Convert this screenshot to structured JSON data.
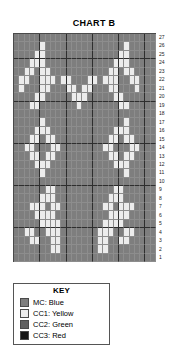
{
  "chart": {
    "title": "CHART B",
    "columns": 27,
    "rows": 27,
    "row_numbers": [
      27,
      26,
      25,
      24,
      23,
      22,
      21,
      20,
      19,
      18,
      17,
      16,
      15,
      14,
      13,
      12,
      11,
      10,
      9,
      8,
      7,
      6,
      5,
      4,
      3,
      2,
      1
    ]
  },
  "legend": {
    "title": "KEY",
    "items": [
      {
        "label": "MC: Blue",
        "code": "MC",
        "color_name": "Blue",
        "swatch": "#7e7e7e",
        "key": "mc"
      },
      {
        "label": "CC1: Yellow",
        "code": "CC1",
        "color_name": "Yellow",
        "swatch": "#ececec",
        "key": "cc1"
      },
      {
        "label": "CC2: Green",
        "code": "CC2",
        "color_name": "Green",
        "swatch": "#616161",
        "key": "cc2"
      },
      {
        "label": "CC3: Red",
        "code": "CC3",
        "color_name": "Red",
        "swatch": "#161616",
        "key": "cc3"
      }
    ]
  },
  "chart_data": {
    "type": "heatmap",
    "title": "CHART B",
    "xlabel": "",
    "ylabel": "",
    "legend_position": "below",
    "grid": true,
    "palette": {
      "mc": "#7e7e7e",
      "cc1": "#ececec",
      "cc2": "#616161",
      "cc3": "#161616"
    },
    "row_order": "top-to-bottom is row 27 down to row 1",
    "cells": [
      [
        "mc",
        "mc",
        "mc",
        "mc",
        "mc",
        "mc",
        "mc",
        "mc",
        "mc",
        "mc",
        "mc",
        "mc",
        "mc",
        "mc",
        "mc",
        "mc",
        "mc",
        "mc",
        "mc",
        "mc",
        "mc",
        "mc",
        "mc",
        "mc",
        "mc",
        "mc",
        "mc"
      ],
      [
        "mc",
        "mc",
        "mc",
        "mc",
        "mc",
        "cc1",
        "mc",
        "mc",
        "mc",
        "mc",
        "mc",
        "mc",
        "mc",
        "mc",
        "mc",
        "mc",
        "mc",
        "mc",
        "mc",
        "mc",
        "mc",
        "cc1",
        "mc",
        "mc",
        "mc",
        "mc",
        "mc"
      ],
      [
        "mc",
        "mc",
        "mc",
        "mc",
        "cc1",
        "cc1",
        "mc",
        "mc",
        "mc",
        "mc",
        "mc",
        "mc",
        "mc",
        "mc",
        "mc",
        "mc",
        "mc",
        "mc",
        "mc",
        "mc",
        "cc1",
        "cc1",
        "mc",
        "mc",
        "mc",
        "mc",
        "mc"
      ],
      [
        "mc",
        "mc",
        "mc",
        "cc1",
        "cc1",
        "cc1",
        "mc",
        "mc",
        "mc",
        "mc",
        "mc",
        "mc",
        "mc",
        "mc",
        "mc",
        "mc",
        "mc",
        "mc",
        "mc",
        "cc1",
        "cc1",
        "cc1",
        "mc",
        "mc",
        "mc",
        "mc",
        "mc"
      ],
      [
        "mc",
        "mc",
        "cc1",
        "cc1",
        "mc",
        "cc1",
        "cc1",
        "mc",
        "mc",
        "mc",
        "mc",
        "mc",
        "mc",
        "mc",
        "mc",
        "mc",
        "mc",
        "mc",
        "cc1",
        "cc1",
        "mc",
        "cc1",
        "cc1",
        "mc",
        "mc",
        "mc",
        "mc"
      ],
      [
        "mc",
        "cc1",
        "cc1",
        "mc",
        "mc",
        "cc1",
        "cc1",
        "cc1",
        "mc",
        "cc1",
        "cc1",
        "mc",
        "mc",
        "mc",
        "cc1",
        "cc1",
        "mc",
        "cc1",
        "cc1",
        "cc1",
        "mc",
        "mc",
        "cc1",
        "cc1",
        "mc",
        "mc",
        "mc"
      ],
      [
        "mc",
        "cc1",
        "mc",
        "mc",
        "mc",
        "cc1",
        "cc1",
        "mc",
        "mc",
        "mc",
        "cc1",
        "cc1",
        "mc",
        "cc1",
        "cc1",
        "mc",
        "mc",
        "mc",
        "cc1",
        "cc1",
        "mc",
        "mc",
        "mc",
        "cc1",
        "mc",
        "mc",
        "mc"
      ],
      [
        "mc",
        "mc",
        "mc",
        "mc",
        "cc1",
        "cc1",
        "mc",
        "mc",
        "mc",
        "mc",
        "mc",
        "cc1",
        "cc1",
        "cc1",
        "mc",
        "mc",
        "mc",
        "mc",
        "mc",
        "cc1",
        "cc1",
        "mc",
        "mc",
        "mc",
        "mc",
        "mc",
        "mc"
      ],
      [
        "mc",
        "mc",
        "mc",
        "cc1",
        "cc1",
        "mc",
        "mc",
        "mc",
        "mc",
        "mc",
        "mc",
        "mc",
        "cc1",
        "mc",
        "mc",
        "mc",
        "mc",
        "mc",
        "mc",
        "mc",
        "cc1",
        "cc1",
        "mc",
        "mc",
        "mc",
        "mc",
        "mc"
      ],
      [
        "mc",
        "mc",
        "mc",
        "mc",
        "mc",
        "mc",
        "mc",
        "mc",
        "mc",
        "mc",
        "mc",
        "mc",
        "mc",
        "mc",
        "mc",
        "mc",
        "mc",
        "mc",
        "mc",
        "mc",
        "mc",
        "mc",
        "mc",
        "mc",
        "mc",
        "mc",
        "mc"
      ],
      [
        "mc",
        "mc",
        "mc",
        "mc",
        "mc",
        "cc1",
        "mc",
        "mc",
        "mc",
        "mc",
        "mc",
        "mc",
        "mc",
        "mc",
        "mc",
        "mc",
        "mc",
        "mc",
        "mc",
        "mc",
        "mc",
        "cc1",
        "mc",
        "mc",
        "mc",
        "mc",
        "mc"
      ],
      [
        "mc",
        "mc",
        "mc",
        "mc",
        "cc1",
        "cc1",
        "cc1",
        "mc",
        "mc",
        "mc",
        "mc",
        "mc",
        "mc",
        "mc",
        "mc",
        "mc",
        "mc",
        "mc",
        "mc",
        "cc1",
        "cc1",
        "cc1",
        "mc",
        "mc",
        "mc",
        "mc",
        "mc"
      ],
      [
        "mc",
        "mc",
        "mc",
        "cc1",
        "cc1",
        "mc",
        "cc1",
        "cc1",
        "mc",
        "mc",
        "mc",
        "mc",
        "mc",
        "mc",
        "mc",
        "mc",
        "mc",
        "mc",
        "cc1",
        "cc1",
        "mc",
        "cc1",
        "cc1",
        "mc",
        "mc",
        "mc",
        "mc"
      ],
      [
        "mc",
        "mc",
        "cc1",
        "cc1",
        "mc",
        "mc",
        "mc",
        "cc1",
        "cc1",
        "mc",
        "mc",
        "mc",
        "mc",
        "mc",
        "mc",
        "mc",
        "mc",
        "cc1",
        "cc1",
        "mc",
        "mc",
        "mc",
        "cc1",
        "cc1",
        "mc",
        "mc",
        "mc"
      ],
      [
        "mc",
        "mc",
        "mc",
        "cc1",
        "cc1",
        "mc",
        "cc1",
        "cc1",
        "mc",
        "mc",
        "mc",
        "mc",
        "mc",
        "mc",
        "mc",
        "mc",
        "mc",
        "mc",
        "cc1",
        "cc1",
        "mc",
        "cc1",
        "cc1",
        "mc",
        "mc",
        "mc",
        "mc"
      ],
      [
        "mc",
        "mc",
        "mc",
        "mc",
        "cc1",
        "cc1",
        "cc1",
        "mc",
        "mc",
        "mc",
        "mc",
        "mc",
        "mc",
        "mc",
        "mc",
        "mc",
        "mc",
        "mc",
        "mc",
        "cc1",
        "cc1",
        "cc1",
        "mc",
        "mc",
        "mc",
        "mc",
        "mc"
      ],
      [
        "mc",
        "mc",
        "mc",
        "mc",
        "mc",
        "cc1",
        "mc",
        "mc",
        "mc",
        "mc",
        "mc",
        "mc",
        "mc",
        "mc",
        "mc",
        "mc",
        "mc",
        "mc",
        "mc",
        "mc",
        "mc",
        "cc1",
        "mc",
        "mc",
        "mc",
        "mc",
        "mc"
      ],
      [
        "mc",
        "mc",
        "mc",
        "mc",
        "mc",
        "mc",
        "mc",
        "mc",
        "mc",
        "mc",
        "mc",
        "mc",
        "mc",
        "mc",
        "mc",
        "mc",
        "mc",
        "mc",
        "mc",
        "mc",
        "mc",
        "mc",
        "mc",
        "mc",
        "mc",
        "mc",
        "mc"
      ],
      [
        "mc",
        "mc",
        "mc",
        "mc",
        "mc",
        "mc",
        "cc1",
        "cc1",
        "mc",
        "mc",
        "mc",
        "mc",
        "mc",
        "mc",
        "mc",
        "mc",
        "mc",
        "mc",
        "mc",
        "cc1",
        "cc1",
        "mc",
        "mc",
        "mc",
        "mc",
        "mc",
        "mc"
      ],
      [
        "mc",
        "mc",
        "mc",
        "mc",
        "mc",
        "cc1",
        "cc1",
        "cc1",
        "mc",
        "mc",
        "mc",
        "mc",
        "mc",
        "mc",
        "mc",
        "mc",
        "mc",
        "mc",
        "cc1",
        "cc1",
        "cc1",
        "mc",
        "mc",
        "mc",
        "mc",
        "mc",
        "mc"
      ],
      [
        "mc",
        "mc",
        "mc",
        "cc1",
        "cc1",
        "cc1",
        "mc",
        "cc1",
        "cc1",
        "mc",
        "mc",
        "mc",
        "mc",
        "mc",
        "mc",
        "mc",
        "mc",
        "cc1",
        "cc1",
        "mc",
        "cc1",
        "cc1",
        "cc1",
        "mc",
        "mc",
        "mc",
        "mc"
      ],
      [
        "mc",
        "mc",
        "mc",
        "mc",
        "cc1",
        "cc1",
        "cc1",
        "cc1",
        "mc",
        "mc",
        "mc",
        "mc",
        "mc",
        "mc",
        "mc",
        "mc",
        "mc",
        "mc",
        "cc1",
        "cc1",
        "cc1",
        "cc1",
        "mc",
        "mc",
        "mc",
        "mc",
        "mc"
      ],
      [
        "mc",
        "mc",
        "mc",
        "mc",
        "mc",
        "cc1",
        "cc1",
        "cc1",
        "cc1",
        "mc",
        "mc",
        "mc",
        "mc",
        "mc",
        "mc",
        "mc",
        "mc",
        "cc1",
        "cc1",
        "cc1",
        "cc1",
        "mc",
        "mc",
        "mc",
        "mc",
        "mc",
        "mc"
      ],
      [
        "mc",
        "mc",
        "cc1",
        "cc1",
        "mc",
        "mc",
        "cc1",
        "cc1",
        "cc1",
        "mc",
        "mc",
        "mc",
        "mc",
        "mc",
        "mc",
        "mc",
        "cc1",
        "cc1",
        "cc1",
        "mc",
        "mc",
        "cc1",
        "cc1",
        "mc",
        "mc",
        "mc",
        "mc"
      ],
      [
        "mc",
        "mc",
        "mc",
        "cc1",
        "cc1",
        "mc",
        "mc",
        "cc1",
        "cc1",
        "mc",
        "mc",
        "mc",
        "mc",
        "mc",
        "mc",
        "mc",
        "cc1",
        "cc1",
        "mc",
        "mc",
        "cc1",
        "cc1",
        "mc",
        "mc",
        "mc",
        "mc",
        "mc"
      ],
      [
        "mc",
        "mc",
        "mc",
        "mc",
        "mc",
        "mc",
        "mc",
        "cc1",
        "cc1",
        "mc",
        "mc",
        "mc",
        "mc",
        "mc",
        "mc",
        "mc",
        "cc1",
        "cc1",
        "mc",
        "mc",
        "mc",
        "mc",
        "mc",
        "mc",
        "mc",
        "mc",
        "mc"
      ],
      [
        "mc",
        "mc",
        "mc",
        "mc",
        "mc",
        "mc",
        "mc",
        "mc",
        "mc",
        "mc",
        "mc",
        "mc",
        "mc",
        "mc",
        "mc",
        "mc",
        "mc",
        "mc",
        "mc",
        "mc",
        "mc",
        "mc",
        "mc",
        "mc",
        "mc",
        "mc",
        "mc"
      ]
    ]
  }
}
